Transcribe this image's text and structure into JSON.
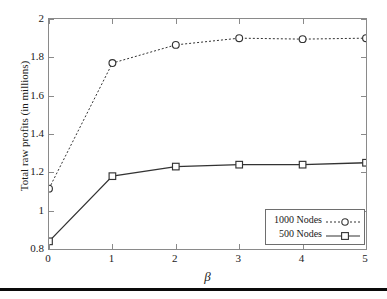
{
  "chart_data": {
    "type": "line",
    "title": "",
    "xlabel": "β",
    "ylabel": "Total raw profits (in millions)",
    "x": [
      0,
      1,
      2,
      3,
      4,
      5
    ],
    "xticklabels": [
      "0",
      "1",
      "2",
      "3",
      "4",
      "5"
    ],
    "yticks": [
      0.8,
      1,
      1.2,
      1.4,
      1.6,
      1.8,
      2
    ],
    "yticklabels": [
      "0.8",
      "1",
      "1.2",
      "1.4",
      "1.6",
      "1.8",
      "2"
    ],
    "xlim": [
      0,
      5
    ],
    "ylim": [
      0.8,
      2
    ],
    "grid": false,
    "legend_position": "lower right",
    "series": [
      {
        "name": "1000 Nodes",
        "values": [
          1.115,
          1.77,
          1.865,
          1.9,
          1.895,
          1.9
        ],
        "linestyle": "dotted",
        "marker": "circle",
        "color": "#333333"
      },
      {
        "name": "500 Nodes",
        "values": [
          0.84,
          1.18,
          1.23,
          1.24,
          1.24,
          1.25
        ],
        "linestyle": "solid",
        "marker": "square",
        "color": "#333333"
      }
    ]
  },
  "legend": {
    "items": [
      {
        "label": "1000 Nodes"
      },
      {
        "label": "500 Nodes"
      }
    ]
  },
  "colors": {
    "axis": "#8a8a8a",
    "line": "#333333",
    "text": "#1a1a1a",
    "rule": "#0a0a0a"
  }
}
